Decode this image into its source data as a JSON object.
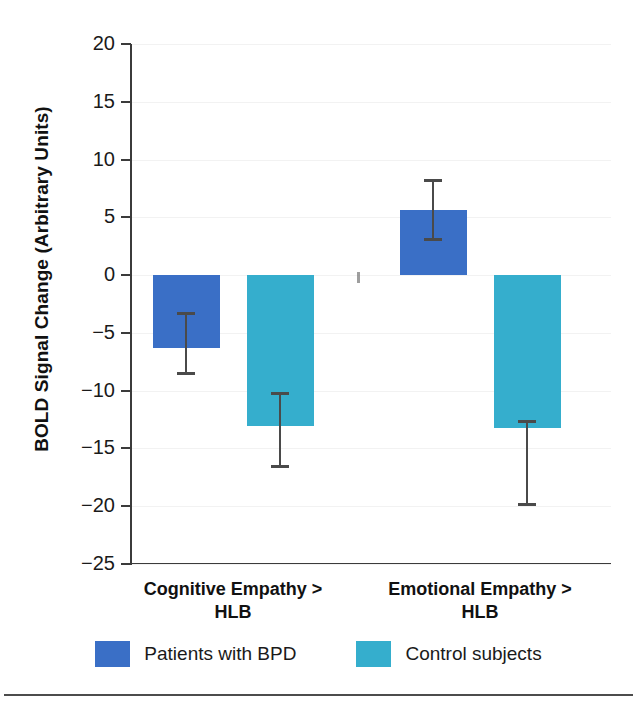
{
  "figure": {
    "top_artifact_text": "",
    "bottom_rule": "divider"
  },
  "chart_data": {
    "type": "bar",
    "title": "",
    "subtitle": "",
    "xlabel": "",
    "ylabel": "BOLD Signal Change (Arbitrary Units)",
    "ylim": [
      -25,
      20
    ],
    "ytick_step": 5,
    "yticks": [
      20,
      15,
      10,
      5,
      0,
      -5,
      -10,
      -15,
      -20,
      -25
    ],
    "ytick_labels": [
      "20",
      "15",
      "10",
      "5",
      "0",
      "−5",
      "−10",
      "−15",
      "−20",
      "−25"
    ],
    "grid": true,
    "grid_axis": "y",
    "legend_position": "bottom-center",
    "error_bars": "SEM",
    "categories": [
      "Cognitive Empathy > HLB",
      "Emotional Empathy > HLB"
    ],
    "category_lines": [
      [
        "Cognitive Empathy >",
        "HLB"
      ],
      [
        "Emotional Empathy >",
        "HLB"
      ]
    ],
    "series": [
      {
        "name": "Patients with BPD",
        "color": "#3a6fc6",
        "values": [
          -6.3,
          5.6
        ],
        "errors": [
          2.6,
          2.5
        ],
        "error_low": [
          -8.5,
          3.1
        ],
        "error_high": [
          -3.3,
          8.2
        ]
      },
      {
        "name": "Control subjects",
        "color": "#35aecd",
        "values": [
          -13.1,
          -13.2
        ],
        "errors": [
          3.4,
          6.6
        ],
        "error_low": [
          -16.5,
          -19.8
        ],
        "error_high": [
          -10.2,
          -12.6
        ]
      }
    ]
  },
  "legend": {
    "items": [
      {
        "label": "Patients with BPD",
        "color": "#3a6fc6"
      },
      {
        "label": "Control subjects",
        "color": "#35aecd"
      }
    ]
  },
  "axis": {
    "line_color": "#3b3b3b",
    "grid_color": "#f2f2f2"
  }
}
